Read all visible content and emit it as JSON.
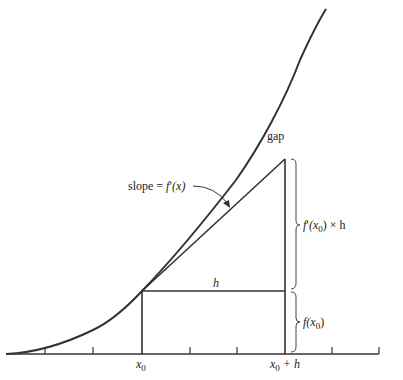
{
  "diagram": {
    "type": "derivative-approximation",
    "labels": {
      "gap": "gap",
      "slope_prefix": "slope = ",
      "slope_f": "f",
      "slope_prime": "′",
      "slope_arg": "(x)",
      "h": "h",
      "fprime_f": "f",
      "fprime_prime": "′",
      "fprime_open": "(x",
      "fprime_sub": "0",
      "fprime_close": ") × h",
      "fx0_f": "f",
      "fx0_open": "(x",
      "fx0_sub": "0",
      "fx0_close": ")",
      "x0": "x",
      "x0_sub": "0",
      "x0h": "x",
      "x0h_sub": "0",
      "x0h_suffix": " + h"
    },
    "colors": {
      "line": "#333333",
      "text": "#222222",
      "background": "#ffffff"
    },
    "axis": {
      "y": 354,
      "x_start": 6,
      "x_end": 379,
      "ticks_x": [
        45,
        93,
        142,
        190,
        237,
        285,
        332,
        379
      ]
    },
    "points": {
      "x0": [
        142,
        291
      ],
      "x0_plus_h_base": [
        285,
        291
      ],
      "tangent_end": [
        285,
        159
      ]
    }
  }
}
